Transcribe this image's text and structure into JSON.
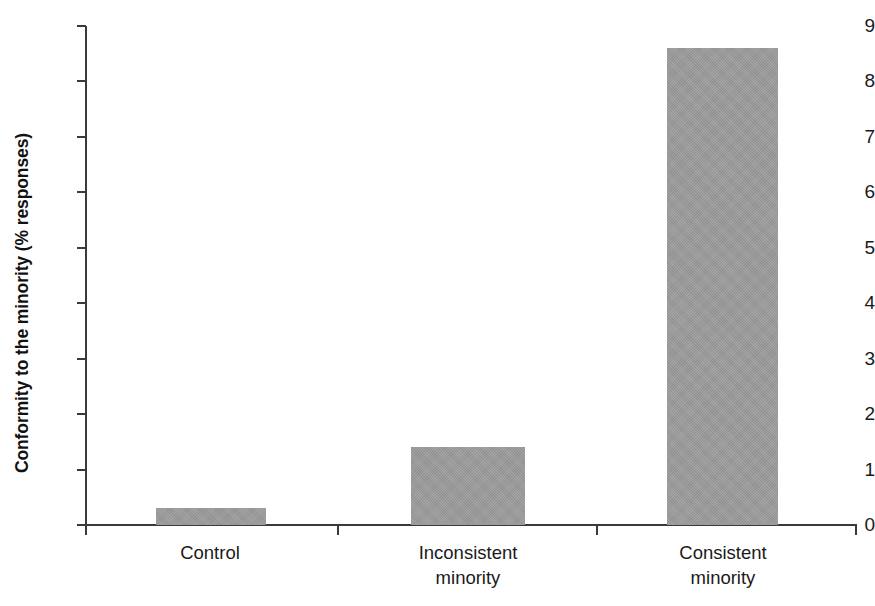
{
  "chart_data": {
    "type": "bar",
    "title": "",
    "xlabel": "",
    "ylabel": "Conformity to the minority (% responses)",
    "categories": [
      "Control",
      "Inconsistent minority",
      "Consistent minority"
    ],
    "category_lines": [
      [
        "Control"
      ],
      [
        "Inconsistent",
        "minority"
      ],
      [
        "Consistent",
        "minority"
      ]
    ],
    "values": [
      0.3,
      1.4,
      8.6
    ],
    "ylim": [
      0,
      9
    ],
    "ytick_labels": [
      "0",
      "1",
      "2",
      "3",
      "4",
      "5",
      "6",
      "7",
      "8",
      "9"
    ],
    "ytick_values": [
      0,
      1,
      2,
      3,
      4,
      5,
      6,
      7,
      8,
      9
    ],
    "grid": false,
    "legend": "none",
    "bar_color": "#9c9c9c",
    "axis_color": "#3a3a3a",
    "background_color": "#ffffff"
  }
}
